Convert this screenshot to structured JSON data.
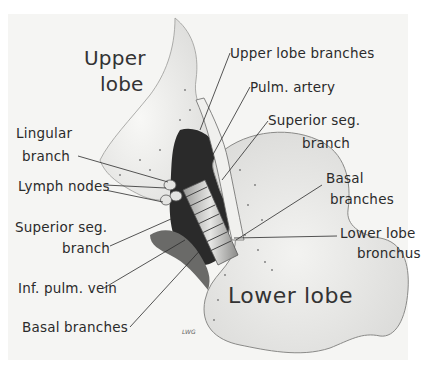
{
  "figure": {
    "region_labels": {
      "upper_lobe_line1": "Upper",
      "upper_lobe_line2": "lobe",
      "lower_lobe": "Lower lobe"
    },
    "labels_left": [
      {
        "line1": "Lingular",
        "line2": "branch"
      },
      {
        "line1": "Lymph nodes"
      },
      {
        "line1": "Superior seg.",
        "line2": "branch"
      },
      {
        "line1": "Inf. pulm. vein"
      },
      {
        "line1": "Basal branches"
      }
    ],
    "labels_right": [
      {
        "line1": "Upper lobe branches"
      },
      {
        "line1": "Pulm. artery"
      },
      {
        "line1": "Superior seg.",
        "line2": "branch"
      },
      {
        "line1": "Basal",
        "line2": "branches"
      },
      {
        "line1": "Lower lobe",
        "line2": "bronchus"
      }
    ],
    "signature": "LWG",
    "colors": {
      "background": "#ffffff",
      "paper": "#f4f4f2",
      "ink": "#2b2b2b",
      "tissue_light": "#ececea",
      "tissue_shade": "#8a8a8a",
      "dark_cavity": "#1e1e1e"
    }
  }
}
